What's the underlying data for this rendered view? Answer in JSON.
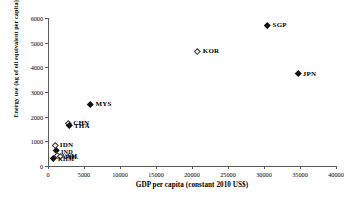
{
  "chart_data": {
    "type": "scatter",
    "title": "",
    "xlabel": "GDP per capita (constant 2010 US$)",
    "ylabel": "Energy use (kg of oil equivalent per capita)",
    "xlim": [
      0,
      40000
    ],
    "ylim": [
      0,
      6000
    ],
    "xticks": [
      0,
      5000,
      10000,
      15000,
      20000,
      25000,
      30000,
      35000,
      40000
    ],
    "yticks": [
      0,
      1000,
      2000,
      3000,
      4000,
      5000,
      6000
    ],
    "xtick_labels": [
      "0",
      "5000",
      "10000",
      "15000",
      "20000",
      "25000",
      "30000",
      "35000",
      "40000"
    ],
    "ytick_labels": [
      "0",
      "1000",
      "2000",
      "3000",
      "4000",
      "5000",
      "6000"
    ],
    "grid": false,
    "legend": "none",
    "marker_styles": [
      "filled-diamond",
      "hollow-diamond"
    ],
    "points": [
      {
        "label": "SGP",
        "x": 30500,
        "y": 5700,
        "marker": "filled",
        "label_size": "normal"
      },
      {
        "label": "KOR",
        "x": 20800,
        "y": 4650,
        "marker": "hollow",
        "label_size": "normal"
      },
      {
        "label": "JPN",
        "x": 34700,
        "y": 3750,
        "marker": "filled",
        "label_size": "normal"
      },
      {
        "label": "MYS",
        "x": 5900,
        "y": 2500,
        "marker": "filled",
        "label_size": "normal"
      },
      {
        "label": "CHN",
        "x": 2800,
        "y": 1750,
        "marker": "hollow",
        "label_size": "normal"
      },
      {
        "label": "THA",
        "x": 2900,
        "y": 1630,
        "marker": "filled",
        "label_size": "normal"
      },
      {
        "label": "IDN",
        "x": 950,
        "y": 850,
        "marker": "hollow",
        "label_size": "normal"
      },
      {
        "label": "IND",
        "x": 1100,
        "y": 620,
        "marker": "filled",
        "label_size": "small"
      },
      {
        "label": "VNM",
        "x": 1250,
        "y": 450,
        "marker": "hollow",
        "label_size": "small"
      },
      {
        "label": "PHL",
        "x": 1700,
        "y": 400,
        "marker": "hollow",
        "label_size": "small"
      },
      {
        "label": "KHM",
        "x": 700,
        "y": 330,
        "marker": "filled",
        "label_size": "small"
      }
    ]
  }
}
